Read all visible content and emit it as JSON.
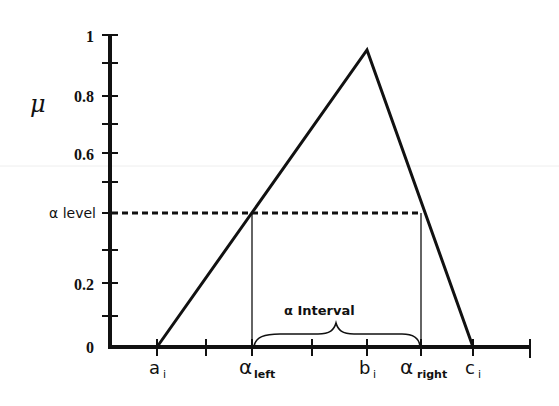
{
  "diagram": {
    "y_axis": {
      "label": "μ",
      "ticks": [
        "1",
        "0.8",
        "0.6",
        "α level",
        "0.2",
        "0"
      ]
    },
    "x_axis": {
      "labels": {
        "a": {
          "main": "a",
          "sub": "i"
        },
        "alpha_left": {
          "main": "α",
          "sub": "left"
        },
        "b": {
          "main": "b",
          "sub": "i"
        },
        "alpha_right": {
          "main": "α",
          "sub": "right"
        },
        "c": {
          "main": "c",
          "sub": "i"
        }
      }
    },
    "annotation": {
      "interval_label": "α Interval"
    },
    "colors": {
      "line": "#111111",
      "background": "#ffffff"
    }
  }
}
